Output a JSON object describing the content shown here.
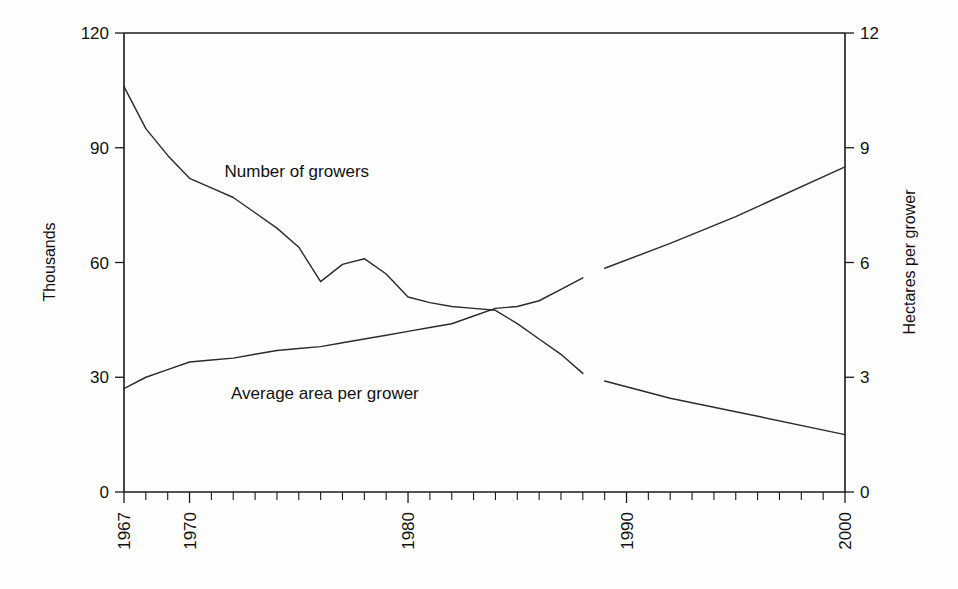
{
  "chart_data": {
    "type": "line",
    "title": "",
    "subtitle": "",
    "xlabel": "",
    "ylabel": "Thousands",
    "y2label": "Hectares per grower",
    "xlim": [
      1967,
      2000
    ],
    "ylim": [
      0,
      120
    ],
    "y2lim": [
      0,
      12
    ],
    "grid": false,
    "legend_position": "inline-annotation",
    "x_tick_labels": [
      "1967",
      "1970",
      "1980",
      "1990",
      "2000"
    ],
    "x_tick_values": [
      1967,
      1970,
      1980,
      1990,
      2000
    ],
    "x_minor_ticks_every": 1,
    "y_tick_labels": [
      "0",
      "30",
      "60",
      "90",
      "120"
    ],
    "y_tick_values": [
      0,
      30,
      60,
      90,
      120
    ],
    "y2_tick_labels": [
      "0",
      "3",
      "6",
      "9",
      "12"
    ],
    "y2_tick_values": [
      0,
      3,
      6,
      9,
      12
    ],
    "annotations": [
      {
        "text": "Number of growers",
        "x": 1971.6,
        "y": 84
      },
      {
        "text": "Average area per grower",
        "x": 1971.9,
        "y": 26
      }
    ],
    "series": [
      {
        "name": "Number of growers",
        "axis": "left",
        "units": "thousands",
        "x": [
          1967,
          1968,
          1969,
          1970,
          1971,
          1972,
          1973,
          1974,
          1975,
          1976,
          1977,
          1978,
          1979,
          1980,
          1981,
          1982,
          1983,
          1984,
          1985,
          1986,
          1987,
          1988
        ],
        "values": [
          106,
          95,
          88,
          82,
          79.5,
          77,
          73,
          69,
          64,
          55,
          59.5,
          61,
          57,
          51,
          49.5,
          48.5,
          48,
          47.5,
          44,
          40,
          36,
          31
        ]
      },
      {
        "name": "Number of growers (projected)",
        "axis": "left",
        "units": "thousands",
        "x": [
          1989,
          1992,
          1995,
          2000
        ],
        "values": [
          29,
          24.5,
          21,
          15
        ]
      },
      {
        "name": "Average area per grower",
        "axis": "right",
        "units": "hectares",
        "x": [
          1967,
          1968,
          1969,
          1970,
          1971,
          1972,
          1973,
          1974,
          1975,
          1976,
          1977,
          1978,
          1979,
          1980,
          1981,
          1982,
          1983,
          1984,
          1985,
          1986,
          1987,
          1988
        ],
        "values": [
          2.7,
          3.0,
          3.2,
          3.4,
          3.45,
          3.5,
          3.6,
          3.7,
          3.75,
          3.8,
          3.9,
          4.0,
          4.1,
          4.2,
          4.3,
          4.4,
          4.6,
          4.8,
          4.85,
          5.0,
          5.3,
          5.6
        ]
      },
      {
        "name": "Average area per grower (projected)",
        "axis": "right",
        "units": "hectares",
        "x": [
          1989,
          1992,
          1995,
          2000
        ],
        "values": [
          5.85,
          6.5,
          7.2,
          8.5
        ]
      }
    ]
  },
  "labels": {
    "left_axis_title": "Thousands",
    "right_axis_title": "Hectares per grower",
    "series_label_growers": "Number of growers",
    "series_label_area": "Average area per grower"
  }
}
